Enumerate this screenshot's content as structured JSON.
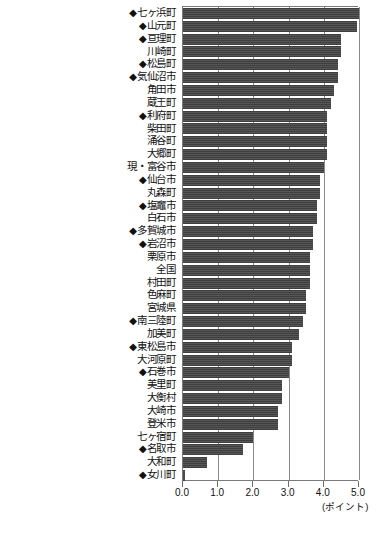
{
  "chart_data": {
    "type": "bar",
    "orientation": "horizontal",
    "title": "",
    "xlabel": "(ポイント)",
    "ylabel": "",
    "xlim": [
      0.0,
      5.0
    ],
    "xticks": [
      0.0,
      1.0,
      2.0,
      3.0,
      4.0,
      5.0
    ],
    "xticklabels": [
      "0.0",
      "1.0",
      "2.0",
      "3.0",
      "4.0",
      "5.0"
    ],
    "grid": true,
    "legend": false,
    "bar_color": "#4a4a4a",
    "marker_symbol": "◆",
    "categories": [
      "七ヶ浜町",
      "山元町",
      "亘理町",
      "川崎町",
      "松島町",
      "気仙沼市",
      "角田市",
      "蔵王町",
      "利府町",
      "柴田町",
      "涌谷町",
      "大郷町",
      "現・富谷市",
      "仙台市",
      "丸森町",
      "塩竈市",
      "白石市",
      "多賀城市",
      "岩沼市",
      "栗原市",
      "全国",
      "村田町",
      "色麻町",
      "宮城県",
      "南三陸町",
      "加美町",
      "東松島市",
      "大河原町",
      "石巻市",
      "美里町",
      "大衡村",
      "大崎市",
      "登米市",
      "七ヶ宿町",
      "名取市",
      "大和町",
      "女川町"
    ],
    "marked": [
      true,
      true,
      true,
      false,
      true,
      true,
      false,
      false,
      true,
      false,
      false,
      false,
      false,
      true,
      false,
      true,
      false,
      true,
      true,
      false,
      false,
      false,
      false,
      false,
      true,
      false,
      true,
      false,
      true,
      false,
      false,
      false,
      false,
      false,
      true,
      false,
      true
    ],
    "values": [
      5.0,
      4.95,
      4.5,
      4.5,
      4.4,
      4.4,
      4.3,
      4.2,
      4.1,
      4.1,
      4.1,
      4.1,
      4.0,
      3.9,
      3.9,
      3.8,
      3.8,
      3.7,
      3.7,
      3.6,
      3.6,
      3.6,
      3.5,
      3.5,
      3.4,
      3.3,
      3.1,
      3.1,
      3.0,
      2.8,
      2.8,
      2.7,
      2.7,
      2.0,
      1.7,
      0.67,
      0.05
    ]
  },
  "axis": {
    "unit_label": "(ポイント)"
  },
  "footnote": {
    "text": ""
  }
}
